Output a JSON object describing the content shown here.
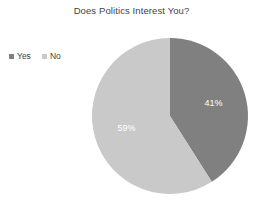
{
  "chart_data": {
    "type": "pie",
    "title": "Does Politics Interest You?",
    "categories": [
      "Yes",
      "No"
    ],
    "values": [
      41,
      59
    ],
    "value_labels": [
      "41%",
      "59%"
    ],
    "colors": [
      "#808080",
      "#c9c9c9"
    ],
    "legend_position": "left",
    "grid": false,
    "xlabel": "",
    "ylabel": "",
    "start_angle_deg": 0,
    "direction": "clockwise",
    "units": "percent"
  },
  "legend": {
    "items": [
      {
        "label": "Yes",
        "color": "#808080"
      },
      {
        "label": "No",
        "color": "#c9c9c9"
      }
    ]
  },
  "slices": [
    {
      "name": "Yes",
      "label": "41%",
      "value": 41,
      "color": "#808080"
    },
    {
      "name": "No",
      "label": "59%",
      "value": 59,
      "color": "#c9c9c9"
    }
  ],
  "geometry": {
    "center_x": 170,
    "center_y": 116,
    "radius": 78
  }
}
